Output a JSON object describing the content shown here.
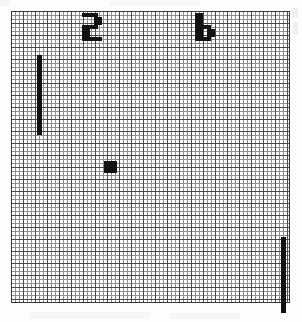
{
  "app": {
    "title": "Pong",
    "background_color": "#ffffff"
  },
  "playfield": {
    "name": "graph-paper-court",
    "x": 11,
    "y": 11,
    "width": 279,
    "height": 292,
    "minor_grid_px": 4,
    "major_grid_px": 12,
    "minor_line_color": "#8e8e8e",
    "major_line_color": "#4a4a4a",
    "border_color": "#3a3a3a",
    "background_color": "#ffffff"
  },
  "score": {
    "left": {
      "label": "2",
      "value": 2,
      "x": 82,
      "y": 13,
      "color": "#121212",
      "pixels": [
        [
          1,
          1,
          1,
          1,
          0
        ],
        [
          0,
          0,
          0,
          1,
          1
        ],
        [
          0,
          0,
          0,
          1,
          1
        ],
        [
          1,
          1,
          1,
          1,
          0
        ],
        [
          1,
          1,
          0,
          0,
          0
        ],
        [
          1,
          1,
          0,
          0,
          0
        ],
        [
          1,
          1,
          1,
          1,
          1
        ]
      ]
    },
    "right": {
      "label": "6",
      "value": 6,
      "x": 195,
      "y": 13,
      "color": "#121212",
      "pixels": [
        [
          1,
          1,
          0,
          0,
          0
        ],
        [
          1,
          1,
          0,
          0,
          0
        ],
        [
          1,
          1,
          0,
          0,
          0
        ],
        [
          1,
          1,
          1,
          1,
          0
        ],
        [
          1,
          1,
          0,
          1,
          1
        ],
        [
          1,
          1,
          0,
          1,
          1
        ],
        [
          1,
          1,
          1,
          1,
          0
        ]
      ]
    }
  },
  "sprites": {
    "paddle_left": {
      "name": "left-paddle",
      "x": 26,
      "y": 44,
      "width": 5,
      "height": 80,
      "color": "#111111"
    },
    "paddle_right": {
      "name": "right-paddle",
      "x": 270,
      "y": 226,
      "width": 5,
      "height": 76,
      "color": "#111111"
    },
    "ball": {
      "name": "ball",
      "x": 93,
      "y": 150,
      "width": 13,
      "height": 12,
      "color": "#111111"
    }
  },
  "artifacts": {
    "note": "faint gray scan marks outside the court"
  }
}
